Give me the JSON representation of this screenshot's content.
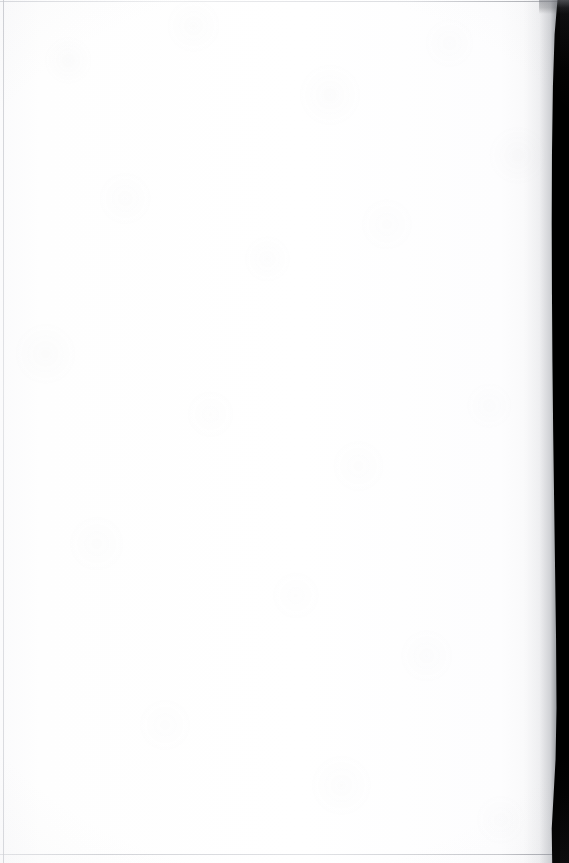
{
  "page": {
    "kind": "scanned-document-page",
    "content_state": "blank",
    "visible_text": "",
    "width_px": 569,
    "height_px": 863
  },
  "colors": {
    "paper": "#fdfdfe",
    "paper_highlight": "#ffffff",
    "paper_shadow": "#f7f7f8",
    "edge_hairline": "#c4c6cc",
    "gutter_shadow": "#60636a",
    "gutter_band": "#000000"
  },
  "regions": {
    "paper_surface": {
      "label": "paper-surface"
    },
    "left_edge": {
      "label": "left-trim-edge"
    },
    "top_edge": {
      "label": "top-trim-edge"
    },
    "bottom_edge": {
      "label": "bottom-trim-edge"
    },
    "gutter_falloff": {
      "label": "binding-shadow-falloff"
    },
    "gutter_band": {
      "label": "scanner-gutter-black-band"
    }
  },
  "accessibility": {
    "caption": "Blank scanned page with dark scanner gutter along the right edge"
  }
}
